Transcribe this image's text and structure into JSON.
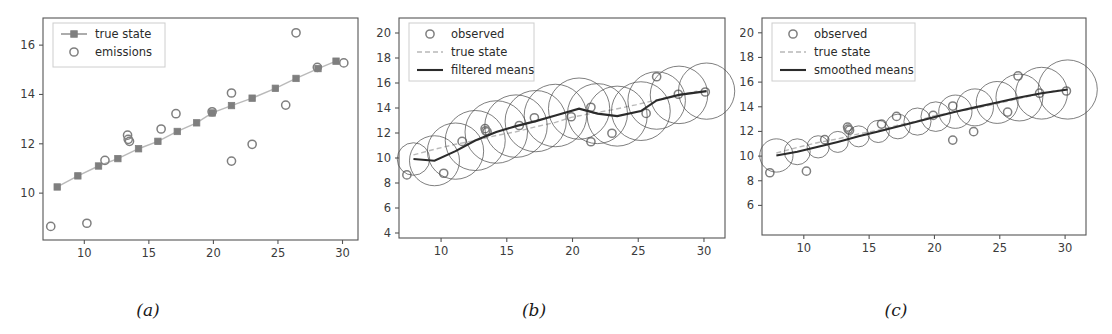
{
  "figure": {
    "caption_a": "(a)",
    "caption_b": "(b)",
    "caption_c": "(c)",
    "colors": {
      "axis": "#555555",
      "tick_label": "#3b3b3b",
      "true_state": "#7f7f7f",
      "emissions": "#7f7f7f",
      "mean_line": "#2b2b2b",
      "uncertainty_circle": "#4d4d4d",
      "legend_border": "#cccccc",
      "background": "#ffffff"
    }
  },
  "chart_data": [
    {
      "type": "line",
      "panel": "a",
      "title": "",
      "xlabel": "",
      "ylabel": "",
      "xlim": [
        6.8,
        31.2
      ],
      "ylim": [
        8.1,
        17.1
      ],
      "xticks": [
        10,
        15,
        20,
        25,
        30
      ],
      "yticks": [
        10,
        12,
        14,
        16
      ],
      "grid": false,
      "legend_position": "upper left",
      "legend": [
        "true state",
        "emissions"
      ],
      "series": [
        {
          "name": "true state",
          "marker": "square",
          "linestyle": "solid",
          "x": [
            7.9,
            9.5,
            11.1,
            12.6,
            14.2,
            15.7,
            17.2,
            18.7,
            19.9,
            21.4,
            23.0,
            24.8,
            26.4,
            28.1,
            29.5
          ],
          "y": [
            10.25,
            10.7,
            11.1,
            11.4,
            11.8,
            12.1,
            12.5,
            12.85,
            13.25,
            13.55,
            13.85,
            14.25,
            14.65,
            15.05,
            15.35
          ]
        },
        {
          "name": "emissions",
          "marker": "circle",
          "linestyle": "none",
          "x": [
            7.4,
            10.2,
            11.6,
            13.35,
            13.4,
            13.5,
            15.95,
            17.1,
            19.9,
            21.4,
            21.4,
            23.0,
            25.6,
            26.4,
            28.05,
            30.1
          ],
          "y": [
            8.65,
            8.78,
            11.33,
            12.35,
            12.18,
            12.1,
            12.6,
            13.22,
            13.3,
            14.06,
            11.3,
            11.98,
            13.57,
            16.5,
            15.1,
            15.28
          ]
        }
      ]
    },
    {
      "type": "line",
      "panel": "b",
      "title": "",
      "xlabel": "",
      "ylabel": "",
      "xlim": [
        6.8,
        31.6
      ],
      "ylim": [
        3.6,
        21.2
      ],
      "xticks": [
        10,
        15,
        20,
        25,
        30
      ],
      "yticks": [
        4,
        6,
        8,
        10,
        12,
        14,
        16,
        18,
        20
      ],
      "grid": false,
      "legend_position": "upper left",
      "legend": [
        "observed",
        "true state",
        "filtered means"
      ],
      "series": [
        {
          "name": "observed",
          "marker": "circle",
          "linestyle": "none",
          "x": [
            7.4,
            10.2,
            11.6,
            13.35,
            13.4,
            13.5,
            15.95,
            17.1,
            19.9,
            21.4,
            21.4,
            23.0,
            25.6,
            26.4,
            28.05,
            30.1
          ],
          "y": [
            8.65,
            8.78,
            11.33,
            12.35,
            12.18,
            12.1,
            12.6,
            13.22,
            13.3,
            14.06,
            11.3,
            11.98,
            13.57,
            16.5,
            15.1,
            15.28
          ]
        },
        {
          "name": "true state",
          "marker": "none",
          "linestyle": "dashed",
          "x": [
            7.9,
            9.5,
            11.1,
            12.6,
            14.2,
            15.7,
            17.2,
            18.7,
            19.9,
            21.4,
            23.0,
            24.8,
            26.4,
            28.1,
            29.5
          ],
          "y": [
            10.25,
            10.7,
            11.1,
            11.4,
            11.8,
            12.1,
            12.5,
            12.85,
            13.25,
            13.55,
            13.85,
            14.25,
            14.65,
            15.05,
            15.35
          ]
        },
        {
          "name": "filtered means",
          "marker": "none",
          "linestyle": "solid",
          "x": [
            7.9,
            9.5,
            11.1,
            12.6,
            14.2,
            15.7,
            17.2,
            18.7,
            20.5,
            21.9,
            23.4,
            25.2,
            26.4,
            28.1,
            30.2
          ],
          "y": [
            9.92,
            9.78,
            10.55,
            11.4,
            12.08,
            12.55,
            12.95,
            13.4,
            13.95,
            13.55,
            13.35,
            13.75,
            14.6,
            15.05,
            15.35
          ],
          "uncertainty_radii_data_units": [
            1.3,
            2.0,
            2.25,
            2.4,
            2.5,
            2.5,
            2.45,
            2.5,
            2.45,
            2.4,
            2.4,
            2.35,
            2.3,
            2.3,
            2.25
          ]
        }
      ]
    },
    {
      "type": "line",
      "panel": "c",
      "title": "",
      "xlabel": "",
      "ylabel": "",
      "xlim": [
        6.8,
        31.6
      ],
      "ylim": [
        3.6,
        21.2
      ],
      "xticks": [
        10,
        15,
        20,
        25,
        30
      ],
      "yticks": [
        6,
        8,
        10,
        12,
        14,
        16,
        18,
        20
      ],
      "grid": false,
      "legend_position": "upper left",
      "legend": [
        "observed",
        "true state",
        "smoothed means"
      ],
      "series": [
        {
          "name": "observed",
          "marker": "circle",
          "linestyle": "none",
          "x": [
            7.4,
            10.2,
            11.6,
            13.35,
            13.4,
            13.5,
            15.95,
            17.1,
            19.9,
            21.4,
            21.4,
            23.0,
            25.6,
            26.4,
            28.05,
            30.1
          ],
          "y": [
            8.65,
            8.78,
            11.33,
            12.35,
            12.18,
            12.1,
            12.6,
            13.22,
            13.3,
            14.06,
            11.3,
            11.98,
            13.57,
            16.5,
            15.1,
            15.28
          ]
        },
        {
          "name": "true state",
          "marker": "none",
          "linestyle": "dashed",
          "x": [
            7.9,
            9.5,
            11.1,
            12.6,
            14.2,
            15.7,
            17.2,
            18.7,
            19.9,
            21.4,
            23.0,
            24.8,
            26.4,
            28.1,
            29.5
          ],
          "y": [
            10.25,
            10.7,
            11.1,
            11.4,
            11.8,
            12.1,
            12.5,
            12.85,
            13.25,
            13.55,
            13.85,
            14.25,
            14.65,
            15.05,
            15.35
          ]
        },
        {
          "name": "smoothed means",
          "marker": "none",
          "linestyle": "solid",
          "x": [
            7.9,
            9.5,
            11.1,
            12.6,
            14.2,
            15.7,
            17.2,
            18.7,
            20.1,
            21.6,
            23.1,
            24.8,
            26.5,
            28.2,
            30.2
          ],
          "y": [
            10.05,
            10.35,
            10.75,
            11.15,
            11.6,
            12.0,
            12.4,
            12.8,
            13.2,
            13.6,
            13.95,
            14.35,
            14.75,
            15.1,
            15.4
          ],
          "uncertainty_radii_data_units": [
            1.35,
            1.05,
            0.9,
            0.85,
            0.85,
            0.9,
            1.0,
            1.1,
            1.2,
            1.35,
            1.5,
            1.7,
            1.9,
            2.1,
            2.4
          ]
        }
      ]
    }
  ]
}
